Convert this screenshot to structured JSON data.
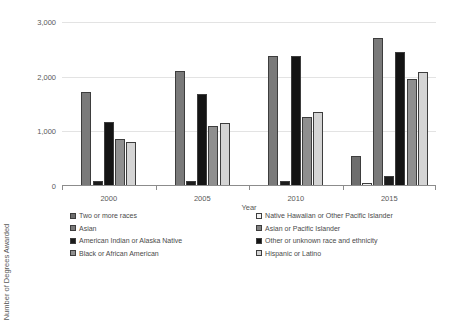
{
  "chart_data": {
    "type": "bar",
    "title": "",
    "xlabel": "Year",
    "ylabel": "Number of Degrees Awarded",
    "categories": [
      "2000",
      "2005",
      "2010",
      "2015"
    ],
    "ylim": [
      0,
      3000
    ],
    "yticks": [
      0,
      1000,
      2000,
      3000
    ],
    "ytick_labels": [
      "0",
      "1,000",
      "2,000",
      "3,000"
    ],
    "grid": true,
    "legend_position": "bottom",
    "series": [
      {
        "name": "Two or more races",
        "color": "#6e6e6e",
        "values": [
          null,
          null,
          null,
          555
        ]
      },
      {
        "name": "Native Hawaiian or Other Pacific Islander",
        "color": "#f2f2f2",
        "values": [
          null,
          null,
          null,
          50
        ]
      },
      {
        "name": "Asian",
        "color": "#7a7a7a",
        "values": [
          1725,
          2095,
          2370,
          2700
        ]
      },
      {
        "name": "Asian or Pacific Islander",
        "color": "#808080",
        "values": [
          null,
          null,
          null,
          null
        ]
      },
      {
        "name": "American Indian or Alaska Native",
        "color": "#1c1c1c",
        "values": [
          85,
          100,
          95,
          190
        ]
      },
      {
        "name": "Other or unknown race and ethnicity",
        "color": "#141414",
        "values": [
          1165,
          1680,
          2370,
          2460
        ]
      },
      {
        "name": "Black or African American",
        "color": "#8f8f8f",
        "values": [
          855,
          1100,
          1270,
          1955
        ]
      },
      {
        "name": "Hispanic or Latino",
        "color": "#d4d4d4",
        "values": [
          810,
          1155,
          1360,
          2090
        ]
      }
    ],
    "groups": [
      {
        "label": "2000",
        "bars": [
          {
            "series": "Asian",
            "value": 1725,
            "color": "#7a7a7a"
          },
          {
            "series": "American Indian or Alaska Native",
            "value": 85,
            "color": "#1c1c1c"
          },
          {
            "series": "Other or unknown race and ethnicity",
            "value": 1165,
            "color": "#141414"
          },
          {
            "series": "Black or African American",
            "value": 855,
            "color": "#8f8f8f"
          },
          {
            "series": "Hispanic or Latino",
            "value": 810,
            "color": "#d4d4d4"
          }
        ]
      },
      {
        "label": "2005",
        "bars": [
          {
            "series": "Asian",
            "value": 2095,
            "color": "#7a7a7a"
          },
          {
            "series": "American Indian or Alaska Native",
            "value": 100,
            "color": "#1c1c1c"
          },
          {
            "series": "Other or unknown race and ethnicity",
            "value": 1680,
            "color": "#141414"
          },
          {
            "series": "Black or African American",
            "value": 1100,
            "color": "#8f8f8f"
          },
          {
            "series": "Hispanic or Latino",
            "value": 1155,
            "color": "#d4d4d4"
          }
        ]
      },
      {
        "label": "2010",
        "bars": [
          {
            "series": "Asian",
            "value": 2370,
            "color": "#7a7a7a"
          },
          {
            "series": "American Indian or Alaska Native",
            "value": 95,
            "color": "#1c1c1c"
          },
          {
            "series": "Other or unknown race and ethnicity",
            "value": 2370,
            "color": "#141414"
          },
          {
            "series": "Black or African American",
            "value": 1270,
            "color": "#8f8f8f"
          },
          {
            "series": "Hispanic or Latino",
            "value": 1360,
            "color": "#d4d4d4"
          }
        ]
      },
      {
        "label": "2015",
        "bars": [
          {
            "series": "Two or more races",
            "value": 555,
            "color": "#6e6e6e"
          },
          {
            "series": "Native Hawaiian or Other Pacific Islander",
            "value": 50,
            "color": "#f2f2f2"
          },
          {
            "series": "Asian",
            "value": 2700,
            "color": "#7a7a7a"
          },
          {
            "series": "American Indian or Alaska Native",
            "value": 190,
            "color": "#1c1c1c"
          },
          {
            "series": "Other or unknown race and ethnicity",
            "value": 2460,
            "color": "#141414"
          },
          {
            "series": "Black or African American",
            "value": 1955,
            "color": "#8f8f8f"
          },
          {
            "series": "Hispanic or Latino",
            "value": 2090,
            "color": "#d4d4d4"
          }
        ]
      }
    ]
  },
  "legend": {
    "column_a": [
      {
        "label": "Two or more races",
        "color": "#6e6e6e"
      },
      {
        "label": "Asian",
        "color": "#7a7a7a"
      },
      {
        "label": "American Indian or Alaska Native",
        "color": "#1c1c1c"
      },
      {
        "label": "Black or African American",
        "color": "#8f8f8f"
      }
    ],
    "column_b": [
      {
        "label": "Native Hawaiian or Other Pacific Islander",
        "color": "#f2f2f2"
      },
      {
        "label": "Asian or Pacific Islander",
        "color": "#808080"
      },
      {
        "label": "Other or unknown race and ethnicity",
        "color": "#141414"
      },
      {
        "label": "Hispanic or Latino",
        "color": "#d4d4d4"
      }
    ]
  }
}
